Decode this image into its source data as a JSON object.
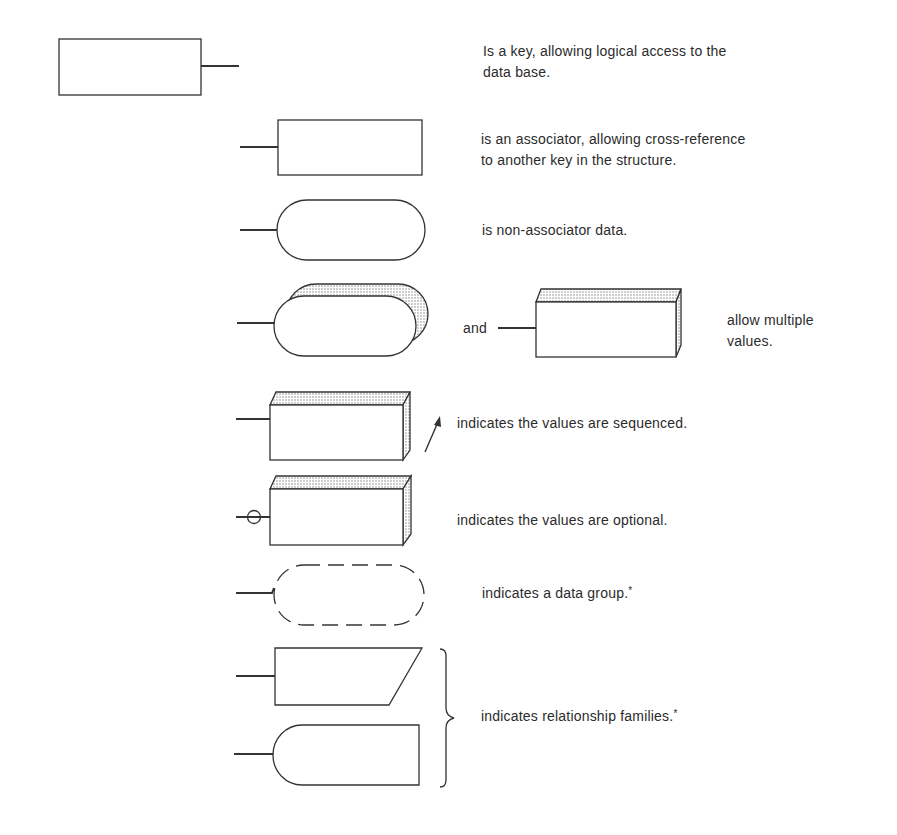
{
  "legend": {
    "items": [
      {
        "symbol": "key",
        "text_line1": "Is a key, allowing logical access to the",
        "text_line2": "data base."
      },
      {
        "symbol": "associator",
        "text_line1": "is an associator, allowing cross-reference",
        "text_line2": "to another key in the structure."
      },
      {
        "symbol": "non-associator-data",
        "text": "is non-associator data."
      },
      {
        "symbol": "multiple-values",
        "connector": "and",
        "text_line1": "allow multiple",
        "text_line2": "values."
      },
      {
        "symbol": "sequenced-values",
        "text": "indicates the values are sequenced."
      },
      {
        "symbol": "optional-values",
        "text": "indicates the values are optional."
      },
      {
        "symbol": "data-group",
        "text": "indicates a data group.",
        "footnote_mark": "*"
      },
      {
        "symbol": "relationship-families",
        "text": "indicates relationship families.",
        "footnote_mark": "*"
      }
    ]
  },
  "colors": {
    "stroke": "#333333",
    "shade": "#d9d9d9",
    "background": "#ffffff"
  }
}
